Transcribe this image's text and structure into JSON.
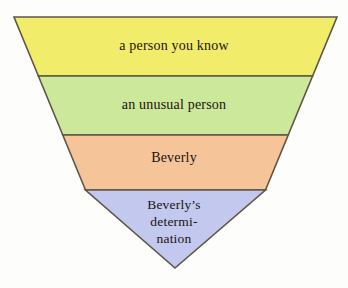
{
  "diagram": {
    "type": "inverted-triangle-funnel",
    "title": "",
    "background_color": "#fdfdfb",
    "outline_color": "#5c5747",
    "text_color": "#1a1410",
    "apex": {
      "x": 175,
      "y": 268
    },
    "top_left": {
      "x": 14,
      "y": 17
    },
    "top_right": {
      "x": 337,
      "y": 17
    },
    "tiers": [
      {
        "id": "tier-1",
        "label": "a person you know",
        "color": "#f2ec6b",
        "color_name": "yellow",
        "top_y": 17,
        "bottom_y": 76
      },
      {
        "id": "tier-2",
        "label": "an unusual person",
        "color": "#cce89a",
        "color_name": "green",
        "top_y": 76,
        "bottom_y": 135
      },
      {
        "id": "tier-3",
        "label": "Beverly",
        "color": "#f6c499",
        "color_name": "orange",
        "top_y": 135,
        "bottom_y": 190
      },
      {
        "id": "tier-4",
        "label": "Beverly's determination",
        "label_lines": [
          "Beverly’s",
          "determi-",
          "nation"
        ],
        "color": "#c3c9ee",
        "color_name": "blue",
        "top_y": 190,
        "bottom_y": 268
      }
    ]
  }
}
